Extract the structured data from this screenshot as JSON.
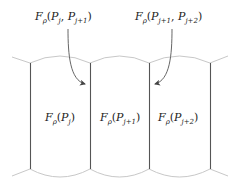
{
  "diagram": {
    "type": "cell-flux-schematic",
    "colors": {
      "background": "#ffffff",
      "cell_wall": "#555555",
      "boundary_arc": "#c8c8c8",
      "arrow": "#555555",
      "text": "#222222"
    },
    "flux_labels": [
      {
        "id": "flux-j-j1",
        "F": "F",
        "sub": "ρ",
        "open": "(",
        "args": [
          "P",
          "j",
          "P",
          "j+1"
        ],
        "close": ")",
        "text": "Fρ(Pj, Pj+1)"
      },
      {
        "id": "flux-j1-j2",
        "F": "F",
        "sub": "ρ",
        "open": "(",
        "args": [
          "P",
          "j+1",
          "P",
          "j+2"
        ],
        "close": ")",
        "text": "Fρ(Pj+1, Pj+2)"
      }
    ],
    "cell_labels": [
      {
        "id": "cell-j",
        "F": "F",
        "sub": "ρ",
        "P": "P",
        "idx": "j",
        "text": "Fρ(Pj)"
      },
      {
        "id": "cell-j1",
        "F": "F",
        "sub": "ρ",
        "P": "P",
        "idx": "j+1",
        "text": "Fρ(Pj+1)"
      },
      {
        "id": "cell-j2",
        "F": "F",
        "sub": "ρ",
        "P": "P",
        "idx": "j+2",
        "text": "Fρ(Pj+2)"
      }
    ],
    "punct": {
      "open": "(",
      "close": ")",
      "comma": ", "
    }
  }
}
